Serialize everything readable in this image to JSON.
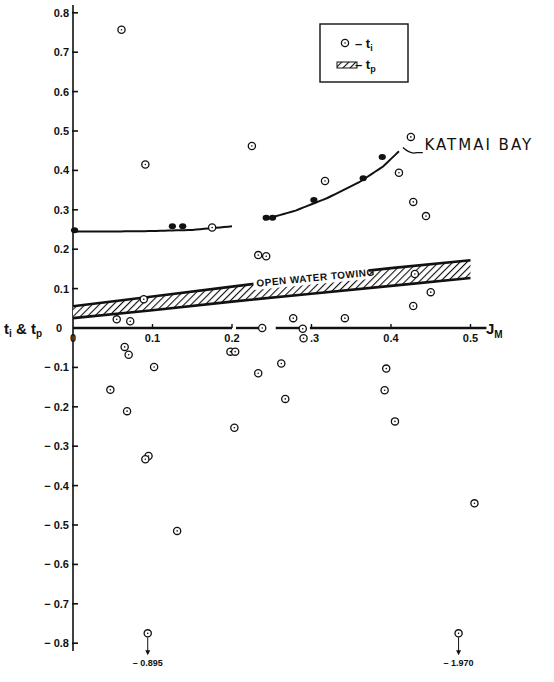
{
  "chart_data": {
    "type": "scatter",
    "title": "",
    "xlabel": "J_M",
    "ylabel": "t_i & t_p",
    "xlim": [
      0,
      0.52
    ],
    "ylim": [
      -0.82,
      0.82
    ],
    "grid": false,
    "x_ticks": [
      "0",
      "0.1",
      "0.2",
      ".3",
      "0.4",
      "0.5"
    ],
    "x_tick_values": [
      0,
      0.1,
      0.2,
      0.3,
      0.4,
      0.5
    ],
    "y_ticks": [
      "0.8",
      "0.7",
      "0.6",
      "0.5",
      "0.4",
      "0.3",
      "0.2",
      "0.1",
      "0",
      "-0.1",
      "-0.2",
      "-0.3",
      "-0.4",
      "-0.5",
      "-0.6",
      "-0.7",
      "-0.8"
    ],
    "y_tick_values": [
      0.8,
      0.7,
      0.6,
      0.5,
      0.4,
      0.3,
      0.2,
      0.1,
      0,
      -0.1,
      -0.2,
      -0.3,
      -0.4,
      -0.5,
      -0.6,
      -0.7,
      -0.8
    ],
    "legend": {
      "position": "top-right",
      "entries": [
        {
          "symbol": "open-circle-dot",
          "label": "– t",
          "subscript": "i"
        },
        {
          "symbol": "hatched-band",
          "label": "– t",
          "subscript": "p"
        }
      ]
    },
    "series": [
      {
        "name": "t_i",
        "marker": "open-circle-dot",
        "points": [
          [
            0.061,
            0.757
          ],
          [
            0.091,
            0.415
          ],
          [
            0.225,
            0.462
          ],
          [
            0.175,
            0.255
          ],
          [
            0.317,
            0.373
          ],
          [
            0.425,
            0.485
          ],
          [
            0.41,
            0.394
          ],
          [
            0.428,
            0.32
          ],
          [
            0.444,
            0.284
          ],
          [
            0.233,
            0.185
          ],
          [
            0.243,
            0.182
          ],
          [
            0.43,
            0.137
          ],
          [
            0.45,
            0.091
          ],
          [
            0.428,
            0.056
          ],
          [
            0.089,
            0.073
          ],
          [
            0.055,
            0.022
          ],
          [
            0.072,
            0.017
          ],
          [
            0.277,
            0.025
          ],
          [
            0.342,
            0.025
          ],
          [
            0.238,
            0.0
          ],
          [
            0.289,
            -0.002
          ],
          [
            0.29,
            -0.026
          ],
          [
            0.065,
            -0.048
          ],
          [
            0.07,
            -0.068
          ],
          [
            0.102,
            -0.099
          ],
          [
            0.047,
            -0.157
          ],
          [
            0.068,
            -0.211
          ],
          [
            0.095,
            -0.325
          ],
          [
            0.091,
            -0.333
          ],
          [
            0.131,
            -0.515
          ],
          [
            0.198,
            -0.06
          ],
          [
            0.204,
            -0.06
          ],
          [
            0.233,
            -0.115
          ],
          [
            0.262,
            -0.09
          ],
          [
            0.267,
            -0.18
          ],
          [
            0.203,
            -0.253
          ],
          [
            0.394,
            -0.103
          ],
          [
            0.392,
            -0.158
          ],
          [
            0.405,
            -0.237
          ],
          [
            0.505,
            -0.445
          ]
        ],
        "off_scale": [
          {
            "x": 0.094,
            "value": -0.895,
            "label": "– 0.895"
          },
          {
            "x": 0.485,
            "value": -1.97,
            "label": "– 1.970"
          }
        ]
      },
      {
        "name": "Katmai Bay (t_p measured)",
        "marker": "solid-dot",
        "points": [
          [
            0.002,
            0.248
          ],
          [
            0.125,
            0.258
          ],
          [
            0.138,
            0.258
          ],
          [
            0.243,
            0.28
          ],
          [
            0.251,
            0.28
          ],
          [
            0.303,
            0.325
          ],
          [
            0.365,
            0.38
          ],
          [
            0.389,
            0.434
          ]
        ]
      },
      {
        "name": "Katmai Bay fit curve",
        "type": "line",
        "x": [
          0.0,
          0.05,
          0.1,
          0.15,
          0.2,
          0.24,
          0.28,
          0.32,
          0.36,
          0.39,
          0.415
        ],
        "values": [
          0.245,
          0.245,
          0.246,
          0.249,
          0.258,
          0.275,
          0.298,
          0.33,
          0.37,
          0.41,
          0.458
        ],
        "gap": [
          0.205,
          0.24
        ]
      },
      {
        "name": "t_p (Open Water Towing band)",
        "type": "area",
        "x": [
          0.0,
          0.1,
          0.2,
          0.3,
          0.4,
          0.5
        ],
        "upper": [
          0.055,
          0.08,
          0.105,
          0.13,
          0.152,
          0.172
        ],
        "lower": [
          0.025,
          0.045,
          0.067,
          0.087,
          0.107,
          0.127
        ]
      }
    ],
    "annotations": [
      {
        "text": "KATMAI BAY",
        "x": 0.43,
        "y": 0.455
      },
      {
        "text": "OPEN WATER TOWING",
        "x": 0.3,
        "y": 0.12
      }
    ]
  }
}
